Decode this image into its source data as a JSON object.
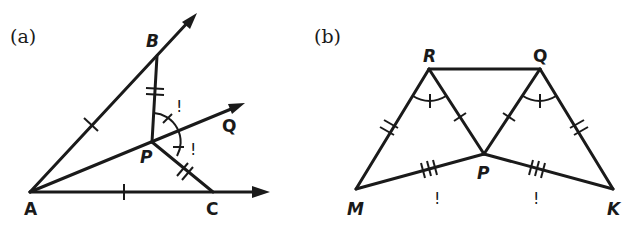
{
  "figure_a": {
    "caption": "(a)",
    "points": {
      "A": "A",
      "B": "B",
      "C": "C",
      "P": "P",
      "Q": "Q"
    },
    "marks": {
      "angle_mark_1": "!",
      "angle_mark_2": "!"
    },
    "description": "Angle BAC with rays AB and AC; ray AQ through P bisects; PB and PC marked equal (double ticks); AB and AC marked equal (single tick); angles BPQ and QPC marked equal"
  },
  "figure_b": {
    "caption": "(b)",
    "points": {
      "R": "R",
      "Q": "Q",
      "P": "P",
      "M": "M",
      "K": "K"
    },
    "marks": {
      "mark_MP": "!",
      "mark_PK": "!"
    },
    "description": "Triangles MRP and KQP with RQ segment; RM=QK (double ticks), RP=QP (single tick), MP=PK (triple ticks), angles MRP and PQK marked equal"
  }
}
